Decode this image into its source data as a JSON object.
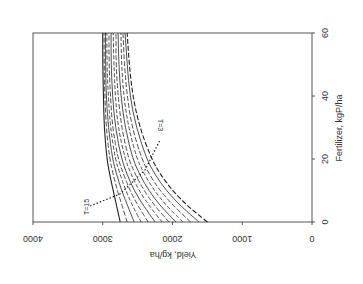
{
  "chart_data": {
    "type": "line",
    "orientation_note": "figure rendered rotated 180 degrees",
    "title": "",
    "xlabel": "Yield, kg/ha",
    "ylabel": "Fertilizer, kgP/ha",
    "xlim": [
      0,
      4000
    ],
    "ylim": [
      0,
      60
    ],
    "x_ticks": [
      "0",
      "1000",
      "2000",
      "3000",
      "4000"
    ],
    "y_ticks": [
      "0",
      "20",
      "40",
      "60"
    ],
    "grid": false,
    "legend": null,
    "annotations": [
      "T=3",
      "T=15"
    ],
    "series_note": "13 curves for T=3..15; fertilizer (y) vs yield (x)",
    "y_points": [
      0,
      5,
      10,
      15,
      20,
      30,
      40,
      50,
      60
    ],
    "series": [
      {
        "name": "T=3",
        "x": [
          1500,
          1780,
          2000,
          2170,
          2300,
          2470,
          2570,
          2620,
          2650
        ]
      },
      {
        "name": "T=4",
        "x": [
          1620,
          1880,
          2090,
          2250,
          2370,
          2520,
          2610,
          2650,
          2680
        ]
      },
      {
        "name": "T=5",
        "x": [
          1740,
          1980,
          2180,
          2330,
          2440,
          2580,
          2650,
          2690,
          2710
        ]
      },
      {
        "name": "T=6",
        "x": [
          1850,
          2080,
          2260,
          2400,
          2510,
          2630,
          2700,
          2730,
          2740
        ]
      },
      {
        "name": "T=7",
        "x": [
          1950,
          2170,
          2340,
          2470,
          2570,
          2680,
          2740,
          2770,
          2780
        ]
      },
      {
        "name": "T=8",
        "x": [
          2050,
          2250,
          2410,
          2530,
          2630,
          2730,
          2780,
          2810,
          2810
        ]
      },
      {
        "name": "T=9",
        "x": [
          2150,
          2330,
          2480,
          2590,
          2680,
          2780,
          2820,
          2840,
          2850
        ]
      },
      {
        "name": "T=10",
        "x": [
          2250,
          2410,
          2550,
          2650,
          2730,
          2820,
          2860,
          2880,
          2880
        ]
      },
      {
        "name": "T=11",
        "x": [
          2350,
          2490,
          2610,
          2700,
          2780,
          2860,
          2890,
          2910,
          2910
        ]
      },
      {
        "name": "T=12",
        "x": [
          2450,
          2570,
          2670,
          2750,
          2820,
          2890,
          2920,
          2940,
          2940
        ]
      },
      {
        "name": "T=13",
        "x": [
          2550,
          2640,
          2730,
          2800,
          2860,
          2920,
          2950,
          2960,
          2960
        ]
      },
      {
        "name": "T=14",
        "x": [
          2650,
          2720,
          2790,
          2850,
          2900,
          2950,
          2970,
          2980,
          2980
        ]
      },
      {
        "name": "T=15",
        "x": [
          2750,
          2800,
          2850,
          2900,
          2940,
          2980,
          2990,
          3000,
          3000
        ]
      }
    ]
  }
}
